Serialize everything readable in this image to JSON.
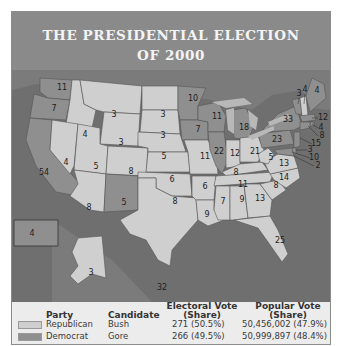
{
  "title": {
    "line1": "THE PRESIDENTIAL ELECTION",
    "line2": "OF 2000"
  },
  "colors": {
    "republican": "#cfcfcf",
    "democrat": "#8f8f8f",
    "ocean": "#6f6f6f",
    "header": "#8a8a8a",
    "lakes": "#b8b8b8"
  },
  "map": {
    "states": [
      {
        "abbr": "WA",
        "ev": "11",
        "party": "D"
      },
      {
        "abbr": "OR",
        "ev": "7",
        "party": "D"
      },
      {
        "abbr": "CA",
        "ev": "54",
        "party": "D"
      },
      {
        "abbr": "ID",
        "ev": "4",
        "party": "R"
      },
      {
        "abbr": "NV",
        "ev": "4",
        "party": "R"
      },
      {
        "abbr": "MT",
        "ev": "3",
        "party": "R"
      },
      {
        "abbr": "WY",
        "ev": "3",
        "party": "R"
      },
      {
        "abbr": "UT",
        "ev": "5",
        "party": "R"
      },
      {
        "abbr": "AZ",
        "ev": "8",
        "party": "R"
      },
      {
        "abbr": "CO",
        "ev": "8",
        "party": "R"
      },
      {
        "abbr": "NM",
        "ev": "5",
        "party": "D"
      },
      {
        "abbr": "ND",
        "ev": "3",
        "party": "R"
      },
      {
        "abbr": "SD",
        "ev": "3",
        "party": "R"
      },
      {
        "abbr": "NE",
        "ev": "5",
        "party": "R"
      },
      {
        "abbr": "KS",
        "ev": "6",
        "party": "R"
      },
      {
        "abbr": "OK",
        "ev": "8",
        "party": "R"
      },
      {
        "abbr": "TX",
        "ev": "32",
        "party": "R"
      },
      {
        "abbr": "MN",
        "ev": "10",
        "party": "D"
      },
      {
        "abbr": "IA",
        "ev": "7",
        "party": "D"
      },
      {
        "abbr": "MO",
        "ev": "11",
        "party": "R"
      },
      {
        "abbr": "AR",
        "ev": "6",
        "party": "R"
      },
      {
        "abbr": "LA",
        "ev": "9",
        "party": "R"
      },
      {
        "abbr": "WI",
        "ev": "11",
        "party": "D"
      },
      {
        "abbr": "IL",
        "ev": "22",
        "party": "D"
      },
      {
        "abbr": "MI",
        "ev": "18",
        "party": "D"
      },
      {
        "abbr": "IN",
        "ev": "12",
        "party": "R"
      },
      {
        "abbr": "OH",
        "ev": "21",
        "party": "R"
      },
      {
        "abbr": "KY",
        "ev": "8",
        "party": "R"
      },
      {
        "abbr": "TN",
        "ev": "11",
        "party": "R"
      },
      {
        "abbr": "MS",
        "ev": "7",
        "party": "R"
      },
      {
        "abbr": "AL",
        "ev": "9",
        "party": "R"
      },
      {
        "abbr": "GA",
        "ev": "13",
        "party": "R"
      },
      {
        "abbr": "FL",
        "ev": "25",
        "party": "R"
      },
      {
        "abbr": "SC",
        "ev": "8",
        "party": "R"
      },
      {
        "abbr": "NC",
        "ev": "14",
        "party": "R"
      },
      {
        "abbr": "VA",
        "ev": "13",
        "party": "R"
      },
      {
        "abbr": "WV",
        "ev": "5",
        "party": "R"
      },
      {
        "abbr": "PA",
        "ev": "23",
        "party": "D"
      },
      {
        "abbr": "NY",
        "ev": "33",
        "party": "D"
      },
      {
        "abbr": "VT",
        "ev": "3",
        "party": "D"
      },
      {
        "abbr": "NH",
        "ev": "4",
        "party": "R"
      },
      {
        "abbr": "ME",
        "ev": "4",
        "party": "D"
      },
      {
        "abbr": "MA",
        "ev": "12",
        "party": "D"
      },
      {
        "abbr": "RI",
        "ev": "4",
        "party": "D"
      },
      {
        "abbr": "CT",
        "ev": "8",
        "party": "D"
      },
      {
        "abbr": "NJ",
        "ev": "15",
        "party": "D"
      },
      {
        "abbr": "DE",
        "ev": "3",
        "party": "D"
      },
      {
        "abbr": "MD",
        "ev": "10",
        "party": "D"
      },
      {
        "abbr": "DC",
        "ev": "2",
        "party": "D"
      },
      {
        "abbr": "AK",
        "ev": "3",
        "party": "R"
      },
      {
        "abbr": "HI",
        "ev": "4",
        "party": "D"
      }
    ]
  },
  "legend": {
    "headers": {
      "party": "Party",
      "candidate": "Candidate",
      "electoral": "Electoral Vote",
      "electoral_sub": "(Share)",
      "popular": "Popular Vote",
      "popular_sub": "(Share)"
    },
    "rows": [
      {
        "party": "Republican",
        "candidate": "Bush",
        "electoral": "271 (50.5%)",
        "popular": "50,456,002 (47.9%)"
      },
      {
        "party": "Democrat",
        "candidate": "Gore",
        "electoral": "266 (49.5%)",
        "popular": "50,999,897 (48.4%)"
      }
    ]
  }
}
